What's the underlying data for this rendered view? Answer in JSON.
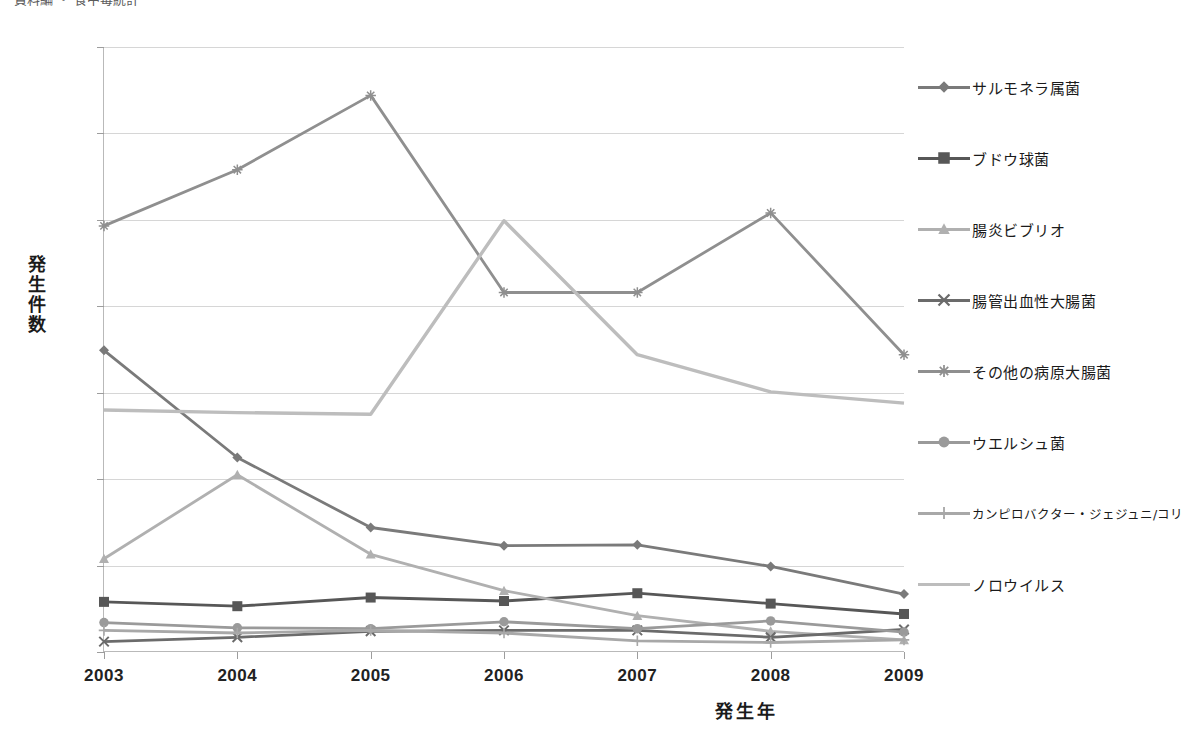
{
  "top_caption": "資料編  ・  食中毒統計",
  "axes": {
    "ylabel": "発生件数",
    "xlabel": "発生年",
    "ytick_labels": [
      "0",
      "100",
      "200",
      "300",
      "400",
      "500",
      "600",
      "700"
    ],
    "xtick_labels": [
      "2003",
      "2004",
      "2005",
      "2006",
      "2007",
      "2008",
      "2009"
    ]
  },
  "legend": {
    "items": [
      {
        "label": "サルモネラ属菌",
        "marker": "diamond",
        "color": "#7a7a7a"
      },
      {
        "label": "ブドウ球菌",
        "marker": "square",
        "color": "#575757"
      },
      {
        "label": "腸炎ビブリオ",
        "marker": "triangle",
        "color": "#b0b0b0"
      },
      {
        "label": "腸管出血性大腸菌",
        "marker": "cross",
        "color": "#6b6b6b"
      },
      {
        "label": "その他の病原大腸菌",
        "marker": "star",
        "color": "#8f8f8f"
      },
      {
        "label": "ウエルシュ菌",
        "marker": "circle",
        "color": "#9a9a9a"
      },
      {
        "label": "カンピロバクター・ジェジュニ/コリ",
        "marker": "plus",
        "color": "#a8a8a8"
      },
      {
        "label": "ノロウイルス",
        "marker": "none",
        "color": "#bdbdbd"
      }
    ]
  },
  "chart_data": {
    "type": "line",
    "title": "",
    "xlabel": "発生年",
    "ylabel": "発生件数",
    "x": [
      2003,
      2004,
      2005,
      2006,
      2007,
      2008,
      2009
    ],
    "ylim": [
      0,
      700
    ],
    "ytick_step": 100,
    "grid": true,
    "legend_position": "right",
    "series": [
      {
        "name": "サルモネラ属菌",
        "marker": "diamond",
        "color": "#7a7a7a",
        "values": [
          349,
          225,
          144,
          123,
          124,
          99,
          67
        ]
      },
      {
        "name": "ブドウ球菌",
        "marker": "square",
        "color": "#575757",
        "values": [
          58,
          53,
          63,
          59,
          68,
          56,
          44
        ]
      },
      {
        "name": "腸炎ビブリオ",
        "marker": "triangle",
        "color": "#b0b0b0",
        "values": [
          108,
          205,
          113,
          71,
          42,
          24,
          14
        ]
      },
      {
        "name": "腸管出血性大腸菌",
        "marker": "cross",
        "color": "#6b6b6b",
        "values": [
          12,
          17,
          24,
          25,
          25,
          17,
          26
        ]
      },
      {
        "name": "その他の病原大腸菌",
        "marker": "star",
        "color": "#8f8f8f",
        "values": [
          493,
          558,
          644,
          416,
          416,
          508,
          344
        ]
      },
      {
        "name": "ウエルシュ菌",
        "marker": "circle",
        "color": "#9a9a9a",
        "values": [
          34,
          28,
          27,
          35,
          27,
          36,
          23
        ]
      },
      {
        "name": "カンピロバクター・ジェジュニ/コリ",
        "marker": "plus",
        "color": "#a8a8a8",
        "values": [
          25,
          22,
          25,
          22,
          13,
          11,
          14
        ]
      },
      {
        "name": "ノロウイルス",
        "marker": "none",
        "color": "#bdbdbd",
        "values": [
          280,
          277,
          275,
          499,
          344,
          301,
          288
        ]
      }
    ]
  }
}
